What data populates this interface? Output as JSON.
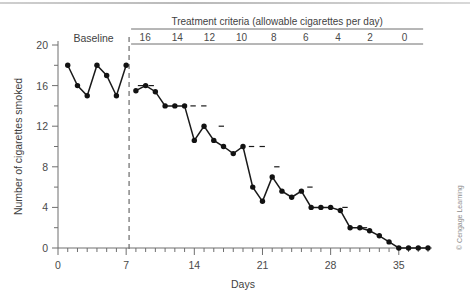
{
  "figure": {
    "credit": "© Cengage Learning",
    "phase_labels": {
      "baseline": "Baseline"
    },
    "header": {
      "title": "Treatment criteria (allowable cigarettes per day)"
    }
  },
  "chart_data": {
    "type": "line",
    "title": "",
    "xlabel": "Days",
    "ylabel": "Number of cigarettes smoked",
    "xlim": [
      0,
      38
    ],
    "ylim": [
      0,
      20
    ],
    "x_ticks": [
      0,
      7,
      14,
      21,
      28,
      35
    ],
    "x_tick_labels": [
      "0",
      "7",
      "14",
      "21",
      "28",
      "35"
    ],
    "x_minor_step": 1,
    "y_ticks": [
      0,
      4,
      8,
      12,
      16,
      20
    ],
    "y_tick_labels": [
      "0",
      "4",
      "8",
      "12",
      "16",
      "20"
    ],
    "y_minor_step": 2,
    "grid": false,
    "legend": "none",
    "phase_change_day": 7.3,
    "criteria_header": "Treatment criteria (allowable cigarettes per day)",
    "criteria": [
      {
        "label": "16",
        "value": 16,
        "start_day": 7.3,
        "end_day": 10.6
      },
      {
        "label": "14",
        "value": 14,
        "start_day": 10.6,
        "end_day": 13.9
      },
      {
        "label": "12",
        "value": 12,
        "start_day": 13.9,
        "end_day": 17.2
      },
      {
        "label": "10",
        "value": 10,
        "start_day": 17.2,
        "end_day": 20.5
      },
      {
        "label": "8",
        "value": 8,
        "start_day": 20.5,
        "end_day": 23.8
      },
      {
        "label": "6",
        "value": 6,
        "start_day": 23.8,
        "end_day": 27.1
      },
      {
        "label": "4",
        "value": 4,
        "start_day": 27.1,
        "end_day": 30.4
      },
      {
        "label": "2",
        "value": 2,
        "start_day": 30.4,
        "end_day": 33.7
      },
      {
        "label": "0",
        "value": 0,
        "start_day": 33.7,
        "end_day": 37.5
      }
    ],
    "series": [
      {
        "name": "Baseline",
        "phase": "baseline",
        "points": [
          {
            "x": 1,
            "y": 18
          },
          {
            "x": 2,
            "y": 16
          },
          {
            "x": 3,
            "y": 15
          },
          {
            "x": 4,
            "y": 18
          },
          {
            "x": 5,
            "y": 17
          },
          {
            "x": 6,
            "y": 15
          },
          {
            "x": 7,
            "y": 18
          }
        ]
      },
      {
        "name": "Treatment",
        "phase": "treatment",
        "points": [
          {
            "x": 8,
            "y": 15.5
          },
          {
            "x": 9,
            "y": 16
          },
          {
            "x": 10,
            "y": 15.4
          },
          {
            "x": 11,
            "y": 14
          },
          {
            "x": 12,
            "y": 14
          },
          {
            "x": 13,
            "y": 14
          },
          {
            "x": 14,
            "y": 10.6
          },
          {
            "x": 15,
            "y": 12
          },
          {
            "x": 16,
            "y": 10.6
          },
          {
            "x": 17,
            "y": 10
          },
          {
            "x": 18,
            "y": 9.3
          },
          {
            "x": 19,
            "y": 10
          },
          {
            "x": 20,
            "y": 6
          },
          {
            "x": 21,
            "y": 4.6
          },
          {
            "x": 22,
            "y": 7
          },
          {
            "x": 23,
            "y": 5.6
          },
          {
            "x": 24,
            "y": 5
          },
          {
            "x": 25,
            "y": 5.6
          },
          {
            "x": 26,
            "y": 4
          },
          {
            "x": 27,
            "y": 4
          },
          {
            "x": 28,
            "y": 4
          },
          {
            "x": 29,
            "y": 3.7
          },
          {
            "x": 30,
            "y": 2
          },
          {
            "x": 31,
            "y": 2
          },
          {
            "x": 32,
            "y": 1.7
          },
          {
            "x": 33,
            "y": 1.2
          },
          {
            "x": 34,
            "y": 0.6
          },
          {
            "x": 35,
            "y": 0
          },
          {
            "x": 36,
            "y": 0
          },
          {
            "x": 37,
            "y": 0
          },
          {
            "x": 38,
            "y": 0
          }
        ]
      }
    ]
  }
}
